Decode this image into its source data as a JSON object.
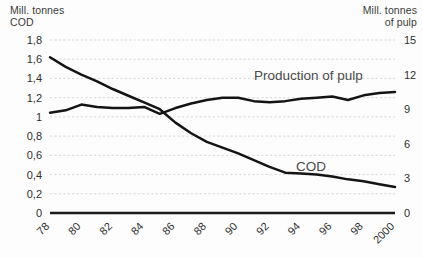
{
  "axes": {
    "left_caption": "Mill. tonnes\nCOD",
    "right_caption": "Mill. tonnes\nof pulp",
    "left_ticks": [
      "1,8",
      "1,6",
      "1,4",
      "1,2",
      "1",
      "0,8",
      "0,6",
      "0,4",
      "0,2",
      "0"
    ],
    "right_ticks": [
      "15",
      "12",
      "9",
      "6",
      "3",
      "0"
    ],
    "x_ticks": [
      "78",
      "80",
      "82",
      "84",
      "86",
      "88",
      "90",
      "92",
      "94",
      "96",
      "98",
      "2000"
    ]
  },
  "labels": {
    "pulp": "Production of pulp",
    "cod": "COD"
  },
  "colors": {
    "line": "#141414",
    "grid": "#c9c9c9",
    "axis": "#1a1a1a",
    "text": "#2f2f2f",
    "label_text": "#4a4a4a",
    "background": "#fdfdfd"
  },
  "chart_data": {
    "type": "line",
    "title": "",
    "xlabel": "",
    "ylabel": "Mill. tonnes COD",
    "y2label": "Mill. tonnes of pulp",
    "grid": true,
    "legend": "inline-annotations",
    "x": [
      1978,
      1979,
      1980,
      1981,
      1982,
      1983,
      1984,
      1985,
      1986,
      1987,
      1988,
      1989,
      1990,
      1991,
      1992,
      1993,
      1994,
      1995,
      1996,
      1997,
      1998,
      1999,
      2000
    ],
    "x_tick_values": [
      1978,
      1980,
      1982,
      1984,
      1986,
      1988,
      1990,
      1992,
      1994,
      1996,
      1998,
      2000
    ],
    "ylim": [
      0,
      1.8
    ],
    "y2lim": [
      0,
      15
    ],
    "yticks": [
      0,
      0.2,
      0.4,
      0.6,
      0.8,
      1.0,
      1.2,
      1.4,
      1.6,
      1.8
    ],
    "y2ticks": [
      0,
      3,
      6,
      9,
      12,
      15
    ],
    "series": [
      {
        "name": "COD",
        "axis": "left",
        "unit": "Mill. tonnes COD",
        "values": [
          1.62,
          1.52,
          1.44,
          1.37,
          1.29,
          1.22,
          1.15,
          1.08,
          0.94,
          0.83,
          0.74,
          0.68,
          0.62,
          0.55,
          0.48,
          0.42,
          0.41,
          0.4,
          0.38,
          0.35,
          0.33,
          0.3,
          0.27
        ]
      },
      {
        "name": "Production of pulp",
        "axis": "right",
        "unit": "Mill. tonnes of pulp",
        "values": [
          8.7,
          8.9,
          9.4,
          9.2,
          9.1,
          9.1,
          9.2,
          8.6,
          9.1,
          9.5,
          9.8,
          10.0,
          10.0,
          9.7,
          9.6,
          9.7,
          9.9,
          10.0,
          10.1,
          9.8,
          10.2,
          10.4,
          10.5
        ]
      }
    ]
  }
}
